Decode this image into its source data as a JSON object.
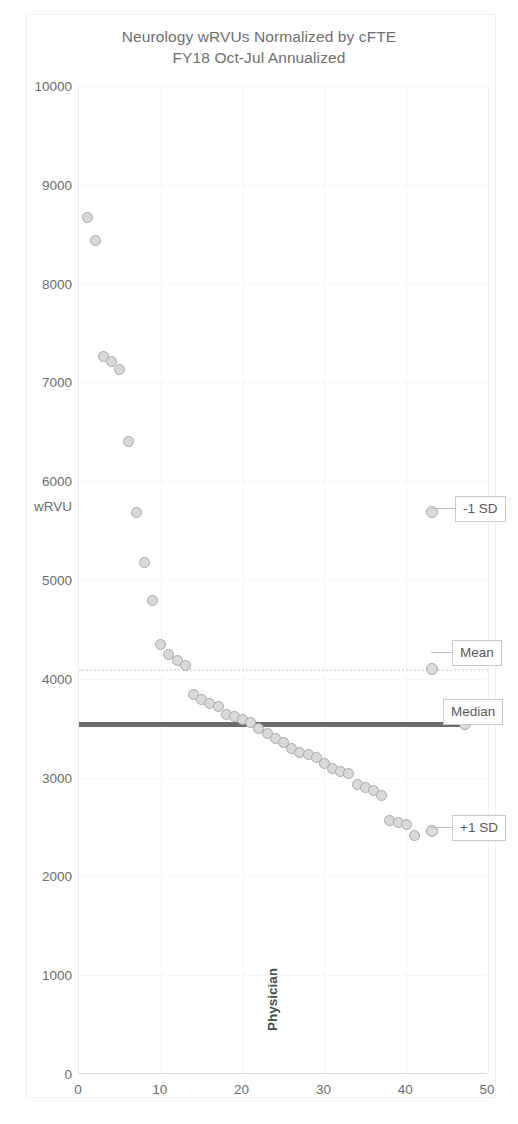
{
  "chart_data": {
    "type": "scatter",
    "title": "Neurology wRVUs Normalized by cFTE",
    "subtitle": "FY18 Oct-Jul Annualized",
    "xlabel": "Physician",
    "ylabel": "wRVU",
    "xlim": [
      0,
      50
    ],
    "ylim": [
      0,
      10000
    ],
    "xticks": [
      0,
      10,
      20,
      30,
      40,
      50
    ],
    "yticks": [
      0,
      1000,
      2000,
      3000,
      4000,
      5000,
      6000,
      7000,
      8000,
      9000,
      10000
    ],
    "grid": true,
    "legend": "none",
    "marker_color": "#d9d9d9",
    "marker_edge_color": "#a8a8a8",
    "series": [
      {
        "name": "wRVU per cFTE",
        "points": [
          [
            1,
            8670
          ],
          [
            2,
            8440
          ],
          [
            3,
            7260
          ],
          [
            4,
            7215
          ],
          [
            5,
            7130
          ],
          [
            6,
            6400
          ],
          [
            7,
            5680
          ],
          [
            8,
            5180
          ],
          [
            9,
            4790
          ],
          [
            10,
            4350
          ],
          [
            11,
            4250
          ],
          [
            12,
            4190
          ],
          [
            13,
            4130
          ],
          [
            14,
            3840
          ],
          [
            15,
            3790
          ],
          [
            16,
            3750
          ],
          [
            17,
            3720
          ],
          [
            18,
            3640
          ],
          [
            19,
            3620
          ],
          [
            20,
            3590
          ],
          [
            21,
            3560
          ],
          [
            22,
            3500
          ],
          [
            23,
            3450
          ],
          [
            24,
            3400
          ],
          [
            25,
            3360
          ],
          [
            26,
            3290
          ],
          [
            27,
            3250
          ],
          [
            28,
            3230
          ],
          [
            29,
            3200
          ],
          [
            30,
            3140
          ],
          [
            31,
            3090
          ],
          [
            32,
            3060
          ],
          [
            33,
            3040
          ],
          [
            34,
            2930
          ],
          [
            35,
            2900
          ],
          [
            36,
            2870
          ],
          [
            37,
            2820
          ],
          [
            38,
            2570
          ],
          [
            39,
            2550
          ],
          [
            40,
            2530
          ],
          [
            41,
            2410
          ]
        ]
      }
    ],
    "reference_lines": [
      {
        "label": "-1 SD",
        "value": 5690,
        "style": "marker-only",
        "marker_x": 43.2,
        "color": "#c9c9c9"
      },
      {
        "label": "Mean",
        "value": 4100,
        "style": "dotted",
        "marker_x": 43.2,
        "color": "#e3e3e3"
      },
      {
        "label": "Median",
        "value": 3540,
        "style": "solid-thick",
        "marker_x": 47.2,
        "color": "#6b6b6b"
      },
      {
        "label": "+1 SD",
        "value": 2460,
        "style": "marker-only",
        "marker_x": 43.2,
        "color": "#c9c9c9"
      }
    ]
  }
}
